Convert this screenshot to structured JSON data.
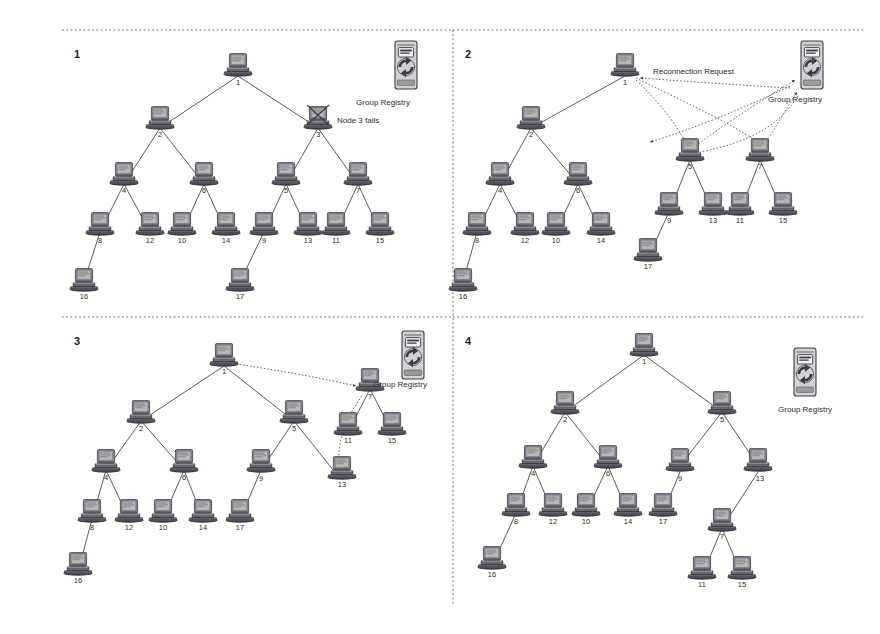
{
  "figure": {
    "panels": [
      {
        "id": "panel-1",
        "number": "1",
        "annotation": "Node 3 fails",
        "registry_label": "Group Registry",
        "nodes": [
          "1",
          "2",
          "3",
          "4",
          "6",
          "5",
          "7",
          "8",
          "12",
          "10",
          "14",
          "9",
          "13",
          "11",
          "15",
          "16",
          "17"
        ],
        "failed_node": "3"
      },
      {
        "id": "panel-2",
        "number": "2",
        "annotation": "Reconnection Request",
        "registry_label": "Group Registry",
        "nodes": [
          "1",
          "2",
          "4",
          "6",
          "8",
          "12",
          "10",
          "14",
          "16",
          "5",
          "9",
          "13",
          "17",
          "7",
          "11",
          "15"
        ],
        "failed_node": null
      },
      {
        "id": "panel-3",
        "number": "3",
        "annotation": "",
        "registry_label": "Group Registry",
        "nodes": [
          "1",
          "2",
          "4",
          "6",
          "8",
          "12",
          "10",
          "14",
          "16",
          "5",
          "9",
          "17",
          "13",
          "7",
          "11",
          "15"
        ],
        "failed_node": null
      },
      {
        "id": "panel-4",
        "number": "4",
        "annotation": "",
        "registry_label": "Group Registry",
        "nodes": [
          "1",
          "2",
          "4",
          "6",
          "8",
          "12",
          "10",
          "14",
          "16",
          "5",
          "9",
          "17",
          "13",
          "7",
          "11",
          "15"
        ],
        "failed_node": null
      }
    ],
    "icons": {
      "node": "computer-icon",
      "registry": "group-registry-server-icon",
      "failure": "failure-cross-icon"
    },
    "colors": {
      "background": "#ffffff",
      "edge": "#4a4a52",
      "text": "#2b2b2b",
      "divider": "#6b6b73",
      "icon_body": "#8f8f96",
      "icon_dark": "#3c3c44",
      "icon_screen": "#a8a8ae"
    }
  }
}
